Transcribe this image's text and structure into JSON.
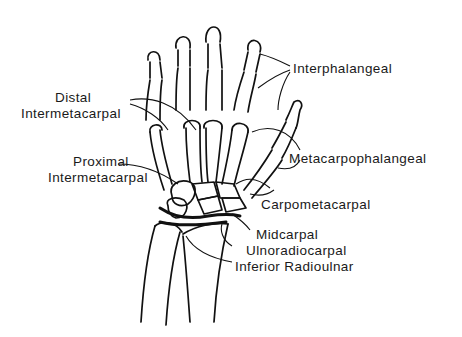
{
  "figure": {
    "colors": {
      "line": "#111111",
      "text": "#1a1a1a",
      "background": "#ffffff"
    }
  },
  "labels": {
    "interphalangeal": "Interphalangeal",
    "distal_intermetacarpal_1": "Distal",
    "distal_intermetacarpal_2": "Intermetacarpal",
    "proximal_intermetacarpal_1": "Proximal",
    "proximal_intermetacarpal_2": "Intermetacarpal",
    "metacarpophalangeal": "Metacarpophalangeal",
    "carpometacarpal": "Carpometacarpal",
    "midcarpal": "Midcarpal",
    "ulnoradiocarpal": "Ulnoradiocarpal",
    "inferior_radioulnar": "Inferior Radioulnar"
  }
}
